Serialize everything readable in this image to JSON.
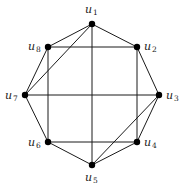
{
  "diagram": {
    "type": "graph",
    "nodes": [
      {
        "id": "u1",
        "label": "u",
        "sub": "1",
        "x": 92,
        "y": 24,
        "lx": 85,
        "ly": 13
      },
      {
        "id": "u2",
        "label": "u",
        "sub": "2",
        "x": 137,
        "y": 47,
        "lx": 144,
        "ly": 50
      },
      {
        "id": "u3",
        "label": "u",
        "sub": "3",
        "x": 159,
        "y": 95,
        "lx": 166,
        "ly": 99
      },
      {
        "id": "u4",
        "label": "u",
        "sub": "4",
        "x": 137,
        "y": 142,
        "lx": 144,
        "ly": 146
      },
      {
        "id": "u5",
        "label": "u",
        "sub": "5",
        "x": 92,
        "y": 165,
        "lx": 85,
        "ly": 181
      },
      {
        "id": "u6",
        "label": "u",
        "sub": "6",
        "x": 48,
        "y": 142,
        "lx": 28,
        "ly": 146
      },
      {
        "id": "u7",
        "label": "u",
        "sub": "7",
        "x": 25,
        "y": 95,
        "lx": 5,
        "ly": 99
      },
      {
        "id": "u8",
        "label": "u",
        "sub": "8",
        "x": 48,
        "y": 47,
        "lx": 28,
        "ly": 50
      }
    ],
    "edges": [
      [
        "u1",
        "u2"
      ],
      [
        "u2",
        "u3"
      ],
      [
        "u3",
        "u4"
      ],
      [
        "u4",
        "u5"
      ],
      [
        "u5",
        "u6"
      ],
      [
        "u6",
        "u7"
      ],
      [
        "u7",
        "u8"
      ],
      [
        "u8",
        "u1"
      ],
      [
        "u1",
        "u5"
      ],
      [
        "u7",
        "u3"
      ],
      [
        "u8",
        "u2"
      ],
      [
        "u8",
        "u6"
      ],
      [
        "u2",
        "u4"
      ],
      [
        "u6",
        "u4"
      ],
      [
        "u1",
        "u7"
      ],
      [
        "u3",
        "u5"
      ]
    ]
  }
}
